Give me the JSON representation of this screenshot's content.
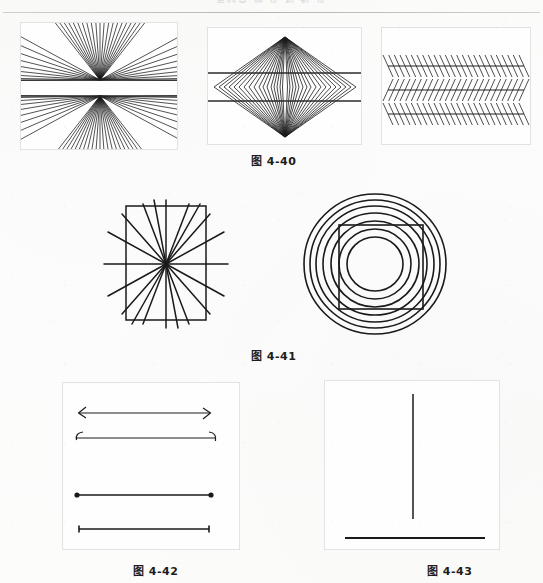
{
  "page": {
    "running_head": "第四章 感 觉 和 知 觉",
    "background_color": "#fdfdfc",
    "ink_color": "#1a1a1a",
    "panel_border_color": "#e2e2e4"
  },
  "figures": [
    {
      "id": "fig-4-40",
      "caption": "图 4-40",
      "caption_x": 251,
      "caption_y": 152,
      "panels": [
        {
          "name": "hering-illusion",
          "type": "radiating-fan-with-parallels",
          "x": 20,
          "y": 22,
          "w": 158,
          "h": 128,
          "bordered": true,
          "description": "Hering illusion: dense fan of straight rays emanating from two vertically stacked focal points, crossed by two horizontal parallel lines",
          "ray_count": 72,
          "focus_points": [
            {
              "cx": 79,
              "cy": 57
            },
            {
              "cx": 79,
              "cy": 73
            }
          ],
          "parallel_lines_y": [
            57,
            73
          ]
        },
        {
          "name": "wundt-diamond-illusion",
          "type": "nested-chevrons-with-parallels",
          "x": 207,
          "y": 27,
          "w": 155,
          "h": 118,
          "bordered": true,
          "description": "Nested diamond chevrons converging at a top apex and a bottom apex, crossed by two horizontal parallel lines",
          "chevron_count": 17,
          "apex_top": {
            "cx": 77,
            "cy": 9
          },
          "apex_bottom": {
            "cx": 77,
            "cy": 109
          },
          "parallel_lines_y": [
            45,
            73
          ]
        },
        {
          "name": "zollner-illusion",
          "type": "hatched-parallels",
          "x": 381,
          "y": 27,
          "w": 150,
          "h": 118,
          "bordered": true,
          "description": "Zollner illusion: three long horizontal lines overlaid with short oblique hatch marks that alternate direction between bands",
          "horizontal_lines_y": [
            38,
            62,
            86
          ],
          "hatch_count_per_band": 24
        }
      ]
    },
    {
      "id": "fig-4-41",
      "caption": "图 4-41",
      "caption_x": 251,
      "caption_y": 347,
      "panels": [
        {
          "name": "hering-square-illusion",
          "type": "radiating-lines-with-square",
          "x": 102,
          "y": 196,
          "w": 128,
          "h": 136,
          "bordered": false,
          "description": "Lines radiating from a single centre point with a square outline superimposed, making the square sides appear bowed",
          "ray_count": 13,
          "center": {
            "cx": 64,
            "cy": 68
          },
          "square": {
            "x": 24,
            "y": 10,
            "w": 80,
            "h": 114
          }
        },
        {
          "name": "orbison-illusion",
          "type": "concentric-circles-with-square",
          "x": 302,
          "y": 192,
          "w": 146,
          "h": 144,
          "bordered": false,
          "description": "Orbison illusion: a set of concentric circles with a square superimposed so its sides appear to bend inward",
          "circle_count": 7,
          "center": {
            "cx": 73,
            "cy": 72
          },
          "radii": [
            28,
            36,
            44,
            52,
            59,
            65,
            71
          ],
          "square": {
            "x": 37,
            "y": 33,
            "w": 84,
            "h": 84
          }
        }
      ]
    },
    {
      "id": "fig-4-42",
      "caption": "图 4-42",
      "caption_x": 133,
      "caption_y": 562,
      "panels": [
        {
          "name": "muller-lyer-illusion",
          "type": "line-endings-comparison",
          "x": 62,
          "y": 382,
          "w": 178,
          "h": 168,
          "bordered": true,
          "description": "Four horizontal lines of identical length with different terminal decorations: inward arrow fins, outward curved fins, solid dots, and plain tick ends",
          "lines": [
            {
              "label": "line-arrow-fins",
              "y": 30,
              "x1": 16,
              "x2": 147,
              "ends": "arrow-fins"
            },
            {
              "label": "line-curved-fins",
              "y": 55,
              "x1": 12,
              "x2": 152,
              "ends": "curved-fins"
            },
            {
              "label": "line-dot-ends",
              "y": 112,
              "x1": 14,
              "x2": 148,
              "ends": "round-dots"
            },
            {
              "label": "line-tick-ends",
              "y": 146,
              "x1": 16,
              "x2": 146,
              "ends": "plain-ticks"
            }
          ]
        }
      ]
    },
    {
      "id": "fig-4-43",
      "caption": "图 4-43",
      "caption_x": 427,
      "caption_y": 562,
      "panels": [
        {
          "name": "horizontal-vertical-illusion",
          "type": "vertical-over-horizontal",
          "x": 324,
          "y": 380,
          "w": 176,
          "h": 170,
          "bordered": true,
          "description": "Horizontal-vertical illusion: an upright vertical line above a horizontal line of the same length; the vertical looks longer",
          "vertical_line": {
            "x": 88,
            "y1": 13,
            "y2": 138
          },
          "horizontal_line": {
            "y": 157,
            "x1": 20,
            "x2": 160
          }
        }
      ]
    }
  ]
}
